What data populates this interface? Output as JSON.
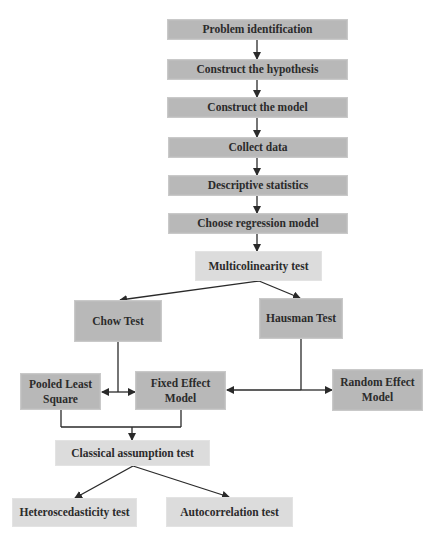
{
  "diagram": {
    "type": "flowchart",
    "title": "",
    "colors": {
      "dark_box": "#b8b8b8",
      "light_box": "#dcdcdc",
      "line": "#2a2a2a",
      "text": "#2b2b2b"
    },
    "nodes": {
      "problem_identification": "Problem identification",
      "construct_hypothesis": "Construct the hypothesis",
      "construct_model": "Construct the model",
      "collect_data": "Collect data",
      "descriptive_statistics": "Descriptive statistics",
      "choose_regression_model": "Choose regression model",
      "multicolinearity_test": "Multicolinearity test",
      "chow_test": "Chow Test",
      "hausman_test": "Hausman Test",
      "pooled_least_square": "Pooled Least Square",
      "fixed_effect_model": "Fixed Effect Model",
      "random_effect_model": "Random Effect Model",
      "classical_assumption_test": "Classical assumption test",
      "heteroscedasticity_test": "Heteroscedasticity test",
      "autocorrelation_test": "Autocorrelation test"
    },
    "edges": [
      [
        "problem_identification",
        "construct_hypothesis"
      ],
      [
        "construct_hypothesis",
        "construct_model"
      ],
      [
        "construct_model",
        "collect_data"
      ],
      [
        "collect_data",
        "descriptive_statistics"
      ],
      [
        "descriptive_statistics",
        "choose_regression_model"
      ],
      [
        "choose_regression_model",
        "multicolinearity_test"
      ],
      [
        "multicolinearity_test",
        "chow_test"
      ],
      [
        "multicolinearity_test",
        "hausman_test"
      ],
      [
        "chow_test",
        "pooled_least_square"
      ],
      [
        "chow_test",
        "fixed_effect_model"
      ],
      [
        "hausman_test",
        "fixed_effect_model"
      ],
      [
        "hausman_test",
        "random_effect_model"
      ],
      [
        "pooled_least_square",
        "classical_assumption_test"
      ],
      [
        "fixed_effect_model",
        "classical_assumption_test"
      ],
      [
        "classical_assumption_test",
        "heteroscedasticity_test"
      ],
      [
        "classical_assumption_test",
        "autocorrelation_test"
      ]
    ]
  }
}
